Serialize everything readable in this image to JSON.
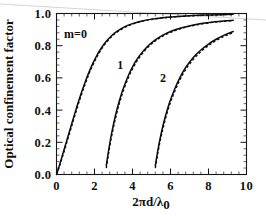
{
  "figure": {
    "background_color": "#ffffff",
    "ink_color": "#0d0d0d",
    "artifact_color": "#cfcfcf"
  },
  "chart_data": {
    "type": "line",
    "title": "",
    "xlabel": "2πd/λ₀",
    "xlabel_parts": {
      "main": "2πd/λ",
      "subscript": "0"
    },
    "ylabel": "Optical confinement factor",
    "xlim": [
      0,
      10
    ],
    "ylim": [
      0.0,
      1.0
    ],
    "xticks": [
      0,
      2,
      4,
      6,
      8,
      10
    ],
    "xtick_labels": [
      "0",
      "2",
      "4",
      "6",
      "8",
      "10"
    ],
    "yticks": [
      0.0,
      0.2,
      0.4,
      0.6,
      0.8,
      1.0
    ],
    "ytick_labels": [
      "0.0",
      "0.2",
      "0.4",
      "0.6",
      "0.8",
      "1.0"
    ],
    "minor_ticks_per_interval": 4,
    "grid": false,
    "legend": "none",
    "annotations": [
      {
        "text": "m=0",
        "x": 1.0,
        "y": 0.845
      },
      {
        "text": "1",
        "x": 3.35,
        "y": 0.655
      },
      {
        "text": "2",
        "x": 5.6,
        "y": 0.575
      }
    ],
    "series": [
      {
        "name": "m=0 exact",
        "mode": 0,
        "style": "solid",
        "x": [
          0.0,
          0.15,
          0.3,
          0.5,
          0.7,
          0.9,
          1.1,
          1.3,
          1.5,
          1.7,
          1.9,
          2.1,
          2.3,
          2.6,
          2.9,
          3.2,
          3.6,
          4.0,
          4.5,
          5.0,
          5.6,
          6.2,
          7.0,
          7.8,
          8.6,
          9.3
        ],
        "y": [
          0.0,
          0.055,
          0.115,
          0.195,
          0.275,
          0.355,
          0.432,
          0.505,
          0.572,
          0.633,
          0.687,
          0.734,
          0.775,
          0.824,
          0.862,
          0.89,
          0.918,
          0.937,
          0.954,
          0.965,
          0.974,
          0.98,
          0.986,
          0.99,
          0.993,
          0.995
        ]
      },
      {
        "name": "m=0 approx",
        "mode": 0,
        "style": "dashed",
        "x": [
          0.0,
          0.15,
          0.3,
          0.5,
          0.7,
          0.9,
          1.1,
          1.3,
          1.5,
          1.7,
          1.9,
          2.1,
          2.3,
          2.6,
          2.9,
          3.2,
          3.6,
          4.0,
          4.5,
          5.0,
          5.6,
          6.2,
          7.0,
          7.8,
          8.6,
          9.3
        ],
        "y": [
          0.0,
          0.048,
          0.104,
          0.182,
          0.261,
          0.34,
          0.418,
          0.491,
          0.559,
          0.621,
          0.676,
          0.724,
          0.766,
          0.817,
          0.856,
          0.885,
          0.914,
          0.934,
          0.952,
          0.963,
          0.973,
          0.979,
          0.985,
          0.989,
          0.992,
          0.994
        ]
      },
      {
        "name": "m=1 exact",
        "mode": 1,
        "style": "solid",
        "x": [
          2.62,
          2.75,
          2.9,
          3.1,
          3.3,
          3.5,
          3.8,
          4.1,
          4.4,
          4.8,
          5.2,
          5.6,
          6.1,
          6.6,
          7.1,
          7.7,
          8.3,
          8.8,
          9.3
        ],
        "y": [
          0.055,
          0.155,
          0.255,
          0.365,
          0.455,
          0.53,
          0.62,
          0.69,
          0.743,
          0.797,
          0.836,
          0.866,
          0.893,
          0.912,
          0.926,
          0.939,
          0.948,
          0.954,
          0.958
        ]
      },
      {
        "name": "m=1 approx",
        "mode": 1,
        "style": "dashed",
        "x": [
          2.62,
          2.75,
          2.9,
          3.1,
          3.3,
          3.5,
          3.8,
          4.1,
          4.4,
          4.8,
          5.2,
          5.6,
          6.1,
          6.6,
          7.1,
          7.7,
          8.3,
          8.8,
          9.3
        ],
        "y": [
          0.04,
          0.136,
          0.236,
          0.346,
          0.438,
          0.514,
          0.606,
          0.678,
          0.733,
          0.789,
          0.829,
          0.86,
          0.888,
          0.908,
          0.923,
          0.936,
          0.946,
          0.952,
          0.956
        ]
      },
      {
        "name": "m=2 exact",
        "mode": 2,
        "style": "solid",
        "x": [
          5.2,
          5.35,
          5.5,
          5.7,
          5.95,
          6.2,
          6.5,
          6.8,
          7.2,
          7.6,
          8.0,
          8.4,
          8.8,
          9.1,
          9.3
        ],
        "y": [
          0.055,
          0.16,
          0.25,
          0.348,
          0.447,
          0.525,
          0.603,
          0.665,
          0.727,
          0.773,
          0.81,
          0.84,
          0.864,
          0.879,
          0.888
        ]
      },
      {
        "name": "m=2 approx",
        "mode": 2,
        "style": "dashed",
        "x": [
          5.2,
          5.35,
          5.5,
          5.7,
          5.95,
          6.2,
          6.5,
          6.8,
          7.2,
          7.6,
          8.0,
          8.4,
          8.8,
          9.1,
          9.3
        ],
        "y": [
          0.04,
          0.143,
          0.233,
          0.331,
          0.431,
          0.51,
          0.589,
          0.652,
          0.715,
          0.763,
          0.801,
          0.832,
          0.857,
          0.872,
          0.882
        ]
      }
    ]
  }
}
